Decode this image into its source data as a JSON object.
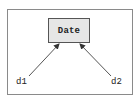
{
  "diagram": {
    "type": "object-reference-diagram",
    "node": {
      "label": "Date",
      "fill": "#e6e6e6",
      "border": "#555555"
    },
    "references": [
      {
        "label": "d1",
        "target": "Date"
      },
      {
        "label": "d2",
        "target": "Date"
      }
    ],
    "edge_color": "#555555",
    "frame_color": "#8a8a8a"
  }
}
